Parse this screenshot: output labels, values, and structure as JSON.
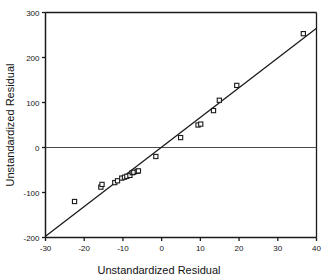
{
  "chart_data": {
    "type": "scatter",
    "title": "",
    "xlabel": "Unstandardized Residual",
    "ylabel": "Unstandardized Residual",
    "xlim": [
      -30,
      40
    ],
    "ylim": [
      -200,
      300
    ],
    "xticks": [
      -30,
      -20,
      -10,
      0,
      10,
      20,
      30,
      40
    ],
    "yticks": [
      -200,
      -100,
      0,
      100,
      200,
      300
    ],
    "xtick_labels": [
      "-30",
      "-20",
      "-10",
      "0",
      "10",
      "20",
      "30",
      "40"
    ],
    "ytick_labels": [
      "-200",
      "-100",
      "0",
      "100",
      "200",
      "300"
    ],
    "grid": false,
    "legend": false,
    "marker": "open-square",
    "marker_color": "#1a1a1a",
    "marker_fill": "#ffffff",
    "line_color": "#1a1a1a",
    "zero_line": {
      "y": 0,
      "color": "#4a4a4a"
    },
    "fit_line": {
      "x": [
        -30,
        40
      ],
      "y": [
        -197,
        265
      ],
      "style": "solid"
    },
    "points": [
      {
        "x": -22.5,
        "y": -120
      },
      {
        "x": -15.7,
        "y": -88
      },
      {
        "x": -15.4,
        "y": -82
      },
      {
        "x": -12.1,
        "y": -78
      },
      {
        "x": -11.4,
        "y": -74
      },
      {
        "x": -10.3,
        "y": -68
      },
      {
        "x": -9.6,
        "y": -66
      },
      {
        "x": -9.0,
        "y": -64
      },
      {
        "x": -8.2,
        "y": -62
      },
      {
        "x": -7.6,
        "y": -56
      },
      {
        "x": -7.2,
        "y": -55
      },
      {
        "x": -6.3,
        "y": -53
      },
      {
        "x": -6.0,
        "y": -52
      },
      {
        "x": -1.5,
        "y": -20
      },
      {
        "x": 4.9,
        "y": 22
      },
      {
        "x": 9.4,
        "y": 50
      },
      {
        "x": 10.1,
        "y": 52
      },
      {
        "x": 13.4,
        "y": 82
      },
      {
        "x": 14.9,
        "y": 105
      },
      {
        "x": 19.4,
        "y": 138
      },
      {
        "x": 36.6,
        "y": 253
      }
    ]
  },
  "axes": {
    "x_title": "Unstandardized Residual",
    "y_title": "Unstandardized Residual"
  }
}
